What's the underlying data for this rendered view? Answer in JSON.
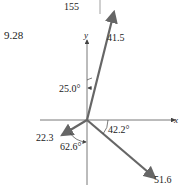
{
  "page_number": "155",
  "figure_label": "9.28",
  "axes": {
    "x_label": "x",
    "y_label": "y"
  },
  "vectors": [
    {
      "name": "v1",
      "magnitude": "41.5",
      "color": "#666666"
    },
    {
      "name": "v2",
      "magnitude": "22.3",
      "color": "#666666"
    },
    {
      "name": "v3",
      "magnitude": "51.6",
      "color": "#666666"
    }
  ],
  "angles": [
    {
      "value": "25.0°",
      "reference": "y-axis"
    },
    {
      "value": "42.2°",
      "reference": "x-axis"
    },
    {
      "value": "62.6°",
      "reference": "negative y-axis"
    }
  ]
}
